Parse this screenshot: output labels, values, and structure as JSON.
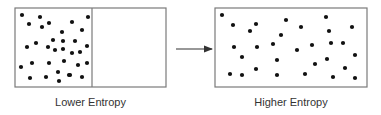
{
  "diagram": {
    "colors": {
      "border": "#7a7a7a",
      "dot": "#111111",
      "arrow": "#333333",
      "text": "#333333"
    },
    "left_panel": {
      "label": "Lower Entropy",
      "box": {
        "x": 15,
        "y": 8,
        "w": 151,
        "h": 79
      },
      "divider_x": 92,
      "dots": [
        [
          22,
          15
        ],
        [
          40,
          17
        ],
        [
          88,
          17
        ],
        [
          72,
          22
        ],
        [
          49,
          23
        ],
        [
          29,
          24
        ],
        [
          42,
          27
        ],
        [
          82,
          30
        ],
        [
          62,
          32
        ],
        [
          53,
          40
        ],
        [
          63,
          41
        ],
        [
          75,
          41
        ],
        [
          36,
          43
        ],
        [
          87,
          46
        ],
        [
          27,
          47
        ],
        [
          48,
          47
        ],
        [
          63,
          49
        ],
        [
          55,
          50
        ],
        [
          80,
          52
        ],
        [
          72,
          53
        ],
        [
          64,
          61
        ],
        [
          32,
          63
        ],
        [
          49,
          63
        ],
        [
          87,
          63
        ],
        [
          78,
          65
        ],
        [
          21,
          67
        ],
        [
          58,
          72
        ],
        [
          69,
          75
        ],
        [
          70,
          75
        ],
        [
          46,
          77
        ],
        [
          82,
          77
        ],
        [
          30,
          78
        ],
        [
          59,
          81
        ]
      ]
    },
    "arrow": {
      "x1": 176,
      "y1": 49,
      "x2": 212,
      "y2": 49
    },
    "right_panel": {
      "label": "Higher Entropy",
      "box": {
        "x": 215,
        "y": 8,
        "w": 152,
        "h": 79
      },
      "dots": [
        [
          222,
          15
        ],
        [
          326,
          17
        ],
        [
          286,
          20
        ],
        [
          256,
          24
        ],
        [
          233,
          25
        ],
        [
          301,
          27
        ],
        [
          352,
          27
        ],
        [
          250,
          31
        ],
        [
          329,
          31
        ],
        [
          281,
          35
        ],
        [
          331,
          43
        ],
        [
          343,
          43
        ],
        [
          273,
          44
        ],
        [
          312,
          45
        ],
        [
          234,
          47
        ],
        [
          257,
          47
        ],
        [
          297,
          50
        ],
        [
          355,
          55
        ],
        [
          242,
          57
        ],
        [
          327,
          59
        ],
        [
          277,
          60
        ],
        [
          315,
          64
        ],
        [
          345,
          68
        ],
        [
          256,
          69
        ],
        [
          230,
          74
        ],
        [
          305,
          74
        ],
        [
          242,
          75
        ],
        [
          277,
          75
        ],
        [
          333,
          77
        ],
        [
          355,
          78
        ]
      ]
    }
  }
}
